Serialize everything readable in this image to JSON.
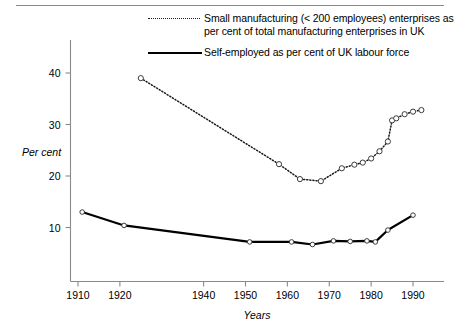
{
  "figure": {
    "top_rule": true
  },
  "legend": {
    "position": "top-center",
    "entries": [
      {
        "style": "dotted",
        "label": "Small manufacturing (< 200 employees) enterprises as\nper cent of total manufacturing enterprises in UK"
      },
      {
        "style": "solid",
        "label": "Self-employed as per cent of UK labour force"
      }
    ]
  },
  "chart_data": {
    "type": "line",
    "title": "",
    "xlabel": "Years",
    "ylabel": "Per cent",
    "xlim": [
      1907,
      1996
    ],
    "ylim": [
      0,
      44
    ],
    "xticks": [
      1910,
      1920,
      1940,
      1950,
      1960,
      1970,
      1980,
      1990
    ],
    "xticklabels": [
      "1910",
      "1920",
      "1940",
      "1950",
      "1960",
      "1970",
      "1980",
      "1990"
    ],
    "yticks": [
      10,
      20,
      30,
      40
    ],
    "yticklabels": [
      "10",
      "20",
      "30",
      "40"
    ],
    "grid": false,
    "markers": "open-circle",
    "series": [
      {
        "name": "Small manufacturing (< 200 employees) enterprises as per cent of total manufacturing enterprises in UK",
        "style": "dotted",
        "x": [
          1925,
          1958,
          1963,
          1968,
          1973,
          1976,
          1978,
          1980,
          1982,
          1984,
          1985,
          1986,
          1988,
          1990,
          1992
        ],
        "y": [
          39.0,
          22.3,
          19.4,
          19.0,
          21.5,
          22.2,
          22.6,
          23.4,
          24.8,
          26.7,
          30.8,
          31.2,
          32.0,
          32.5,
          32.8
        ]
      },
      {
        "name": "Self-employed as per cent of UK labour force",
        "style": "solid",
        "x": [
          1911,
          1921,
          1951,
          1961,
          1966,
          1971,
          1975,
          1979,
          1981,
          1984,
          1990
        ],
        "y": [
          13.0,
          10.4,
          7.2,
          7.2,
          6.7,
          7.4,
          7.3,
          7.4,
          7.2,
          9.5,
          12.4
        ]
      }
    ]
  }
}
